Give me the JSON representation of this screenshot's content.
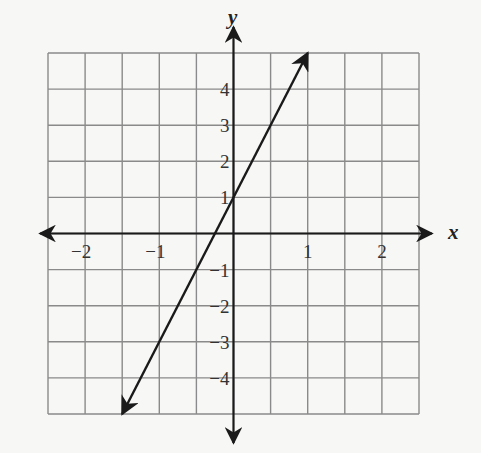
{
  "chart_data": {
    "type": "line",
    "title": "",
    "xlabel": "x",
    "ylabel": "y",
    "xlim": [
      -2.5,
      2.5
    ],
    "ylim": [
      -5,
      5
    ],
    "grid": true,
    "grid_x_step": 0.5,
    "grid_y_step": 1,
    "x_ticks": [
      -2,
      -1,
      1,
      2
    ],
    "x_tick_labels": [
      "−2",
      "−1",
      "1",
      "2"
    ],
    "y_ticks": [
      4,
      3,
      2,
      1,
      -1,
      -2,
      -3,
      -4
    ],
    "y_tick_labels": [
      "4",
      "3",
      "2",
      "1",
      "−1",
      "−2",
      "−3",
      "−4"
    ],
    "series": [
      {
        "name": "line",
        "equation": "y = 4x + 1",
        "slope": 4,
        "intercept": 1,
        "x": [
          -1.5,
          1
        ],
        "y": [
          -5,
          5
        ],
        "arrows_both_ends": true
      }
    ],
    "legend": null
  },
  "colors": {
    "grid": "#8a8a8a",
    "axis": "#1a1a1a",
    "line": "#1a1a1a",
    "background": "#f7f7f5"
  }
}
